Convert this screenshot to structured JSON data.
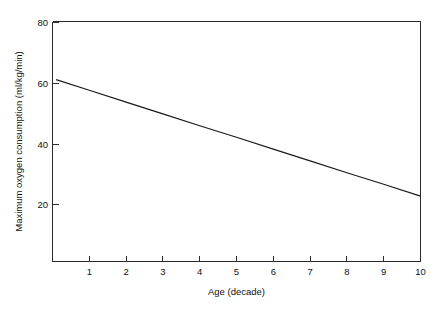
{
  "figure": {
    "name": "maximum-oxygen-consumption-vs-age"
  },
  "chart_data": {
    "type": "line",
    "title": "",
    "xlabel": "Age (decade)",
    "ylabel": "Maximum oxygen consumption (ml/kg/min)",
    "xlim": [
      0,
      10
    ],
    "ylim": [
      0,
      80
    ],
    "xticks": [
      1,
      2,
      3,
      4,
      5,
      6,
      7,
      8,
      9,
      10
    ],
    "xtick_labels": [
      "1",
      "2",
      "3",
      "4",
      "5",
      "6",
      "7",
      "8",
      "9",
      "10"
    ],
    "yticks": [
      20,
      40,
      60,
      80
    ],
    "ytick_labels": [
      "20",
      "40",
      "60",
      "80"
    ],
    "grid": false,
    "legend": "none",
    "series": [
      {
        "name": "Maximum oxygen consumption",
        "x": [
          0.1,
          1,
          2,
          3,
          4,
          5,
          6,
          7,
          8,
          9,
          10
        ],
        "values": [
          61.0,
          57.5,
          53.6,
          49.7,
          45.8,
          42.0,
          38.1,
          34.2,
          30.3,
          26.5,
          22.6
        ],
        "color": "#1a1a1a"
      }
    ]
  },
  "axis_labels": {
    "x_title": "Age (decade)",
    "y_title": "Maximum oxygen consumption (ml/kg/min)"
  },
  "colors": {
    "line": "#1a1a1a",
    "axis": "#2b2b2b",
    "background": "#ffffff"
  }
}
